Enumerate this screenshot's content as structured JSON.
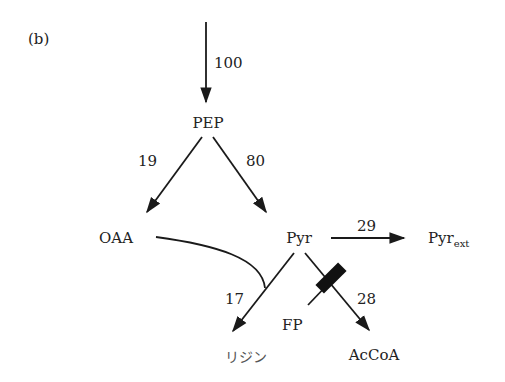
{
  "panel_label": "(b)",
  "nodes": {
    "pep": "PEP",
    "oaa": "OAA",
    "pyr": "Pyr",
    "pyr_ext_base": "Pyr",
    "pyr_ext_sub": "ext",
    "lysine": "リジン",
    "accoa": "AcCoA",
    "fp": "FP"
  },
  "fluxes": {
    "input_to_pep": "100",
    "pep_to_oaa": "19",
    "pep_to_pyr": "80",
    "pyr_to_pyr_ext": "29",
    "to_lysine": "17",
    "pyr_to_accoa": "28"
  },
  "colors": {
    "line": "#1a1a1a",
    "text": "#222222"
  }
}
